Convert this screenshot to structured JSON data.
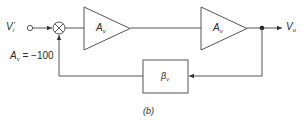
{
  "diagram": {
    "caption": "(b)",
    "input": {
      "symbol": "V",
      "subscript": "i",
      "prime": "′"
    },
    "output": {
      "symbol": "V",
      "subscript": "o"
    },
    "gain_note": {
      "symbol": "A",
      "subscript": "v",
      "rest": " = −100"
    },
    "blocks": [
      {
        "id": "amp1",
        "type": "amplifier",
        "symbol": "A",
        "subscript": "v"
      },
      {
        "id": "amp2",
        "type": "amplifier",
        "symbol": "A",
        "subscript": "v"
      },
      {
        "id": "feedback",
        "type": "box",
        "symbol": "β",
        "subscript": "v"
      }
    ],
    "summing_junction": {
      "glyph": "⊗"
    },
    "connections": [
      "Vi' -> summing_junction",
      "summing_junction -> amp1",
      "amp1 -> amp2",
      "amp2 -> Vo",
      "Vo -> feedback",
      "feedback -> summing_junction"
    ],
    "colors": {
      "stroke": "#555555",
      "text": "#2a2a2a",
      "background": "#ffffff"
    }
  }
}
